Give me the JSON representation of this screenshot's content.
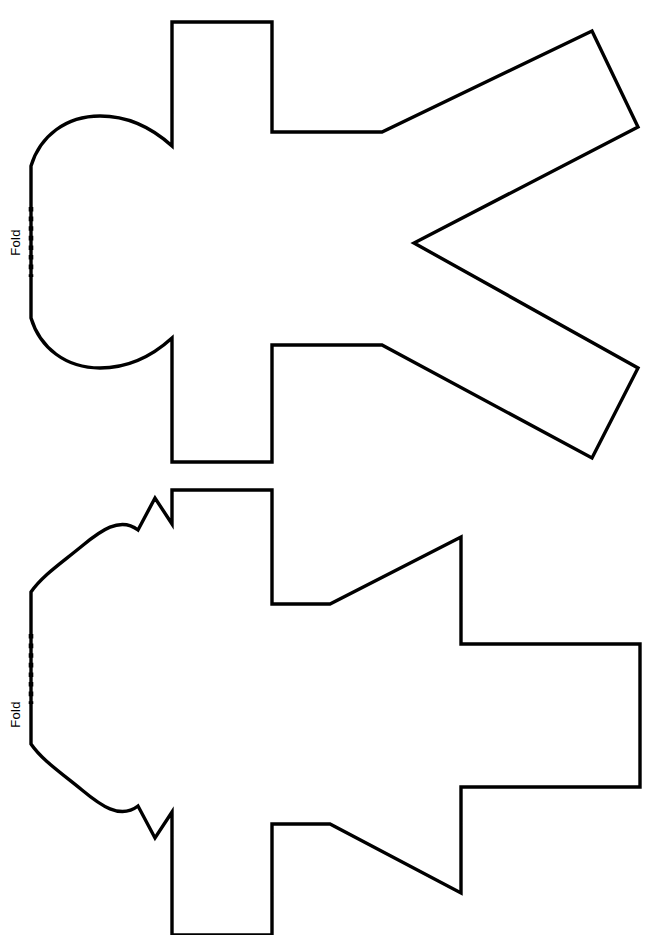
{
  "page": {
    "width": 649,
    "height": 935,
    "background_color": "#ffffff",
    "ink_color": "#000000",
    "caption_text": "with \"Delightful Desk Markers\" on page 51."
  },
  "figures": [
    {
      "id": "figure-top",
      "name": "fold-out-figure-template-1",
      "fold_label": "Fold",
      "description": "Line-art half-figure craft template with rounded head, straight arms angled up-right and down-right, rectangular legs."
    },
    {
      "id": "figure-bottom",
      "name": "fold-out-figure-template-2",
      "fold_label": "Fold",
      "description": "Line-art half-figure craft template with curved pointed-ear head, blocky arm and tapered lower arm, rectangular legs."
    }
  ],
  "graphics": {
    "figure_top_outline": "M 172 22 L 272 22 L 272 132 L 382 132 L 592 31 L 638 127 L 414 243 L 638 368 L 592 458 L 382 345 L 272 345 L 272 462 L 172 462 L 172 338 C 150 358 126 368 100 368 C 66 368 40 348 31 318 L 31 277 L 31 207 L 31 166 C 40 136 66 116 100 116 C 126 116 150 126 172 146 Z",
    "figure_top_fold_line": "M 31 207 L 31 277",
    "figure_bottom_outline": "M 172 490 L 272 490 L 272 604 L 330 604 L 461 537 L 461 644 L 640 644 L 640 787 L 461 787 L 461 893 L 330 824 L 272 824 L 272 935 L 172 935 L 172 812 L 155 838 L 138 806 C 120 820 100 805 82 790 C 60 772 42 760 31 744 L 31 704 L 31 634 L 31 592 C 42 576 60 564 82 546 C 100 531 120 516 138 530 L 155 498 L 172 524 Z",
    "figure_bottom_fold_line": "M 31 634 L 31 704"
  },
  "style": {
    "stroke_width": 3.4,
    "fold_dot_size": 4.6,
    "fold_dot_gap": 5.0
  }
}
